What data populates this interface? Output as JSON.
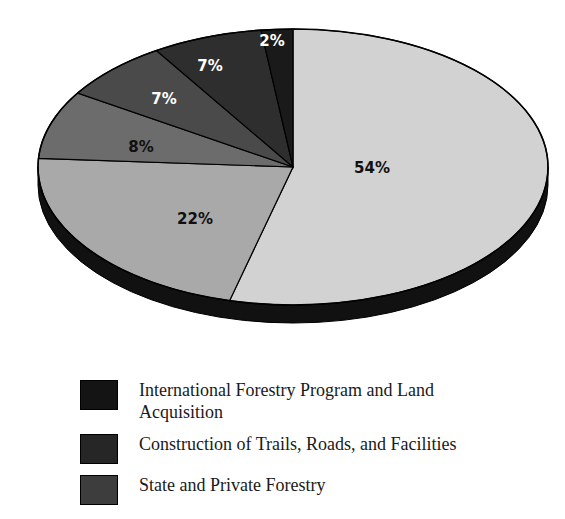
{
  "chart_data": {
    "type": "pie",
    "title": "",
    "subtitle": "",
    "xlabel": "",
    "ylabel": "",
    "grid": false,
    "legend_position": "bottom-left",
    "style": "3d-exploded-ellipse",
    "start_angle_deg": 0,
    "direction": "clockwise",
    "categories": [
      "54%",
      "22%",
      "8%",
      "7%",
      "7%",
      "2%"
    ],
    "values": [
      54,
      22,
      8,
      7,
      7,
      2
    ],
    "value_unit": "percent",
    "slices": [
      {
        "label": "54%",
        "value": 54,
        "fill": "#d2d2d2",
        "label_color": "#101010",
        "label_x": 372,
        "label_y": 173
      },
      {
        "label": "22%",
        "value": 22,
        "fill": "#a9a9a9",
        "label_color": "#101010",
        "label_x": 195,
        "label_y": 224
      },
      {
        "label": "8%",
        "value": 8,
        "fill": "#6c6c6c",
        "label_color": "#101010",
        "label_x": 141,
        "label_y": 152
      },
      {
        "label": "7%",
        "value": 7,
        "fill": "#4a4a4a",
        "label_color": "#ffffff",
        "label_x": 164,
        "label_y": 104
      },
      {
        "label": "7%",
        "value": 7,
        "fill": "#2e2e2e",
        "label_color": "#ffffff",
        "label_x": 210,
        "label_y": 71
      },
      {
        "label": "2%",
        "value": 2,
        "fill": "#1a1a1a",
        "label_color": "#ffffff",
        "label_x": 272,
        "label_y": 46
      }
    ],
    "legend": [
      {
        "swatch_color": "#141414",
        "label": "International Forestry Program and Land\nAcquisition"
      },
      {
        "swatch_color": "#262626",
        "label": "Construction of Trails, Roads, and Facilities"
      },
      {
        "swatch_color": "#3d3d3d",
        "label": "State and Private Forestry"
      }
    ]
  },
  "colors": {
    "background": "#ffffff",
    "outline": "#000000",
    "depth_side": "#111111",
    "label_dark": "#101010",
    "label_light": "#ffffff"
  }
}
